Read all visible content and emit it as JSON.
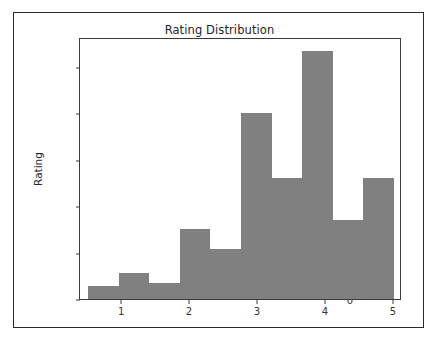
{
  "chart_data": {
    "type": "bar",
    "title": "Rating Distribution",
    "xlabel": "",
    "ylabel": "Rating",
    "xlim": [
      0.38,
      5.12
    ],
    "ylim": [
      0,
      28200
    ],
    "grid": false,
    "legend": null,
    "bin_edges": [
      0.5,
      0.95,
      1.4,
      1.85,
      2.3,
      2.75,
      3.2,
      3.65,
      4.1,
      4.55,
      5.0
    ],
    "categories": [
      "0.50-0.95",
      "0.95-1.40",
      "1.40-1.85",
      "1.85-2.30",
      "2.30-2.75",
      "2.75-3.20",
      "3.20-3.65",
      "3.65-4.10",
      "4.10-4.55",
      "4.55-5.00"
    ],
    "values": [
      1350,
      2850,
      1750,
      7500,
      5400,
      20000,
      13000,
      26700,
      8500,
      13000
    ],
    "bar_color": "#808080",
    "x_ticks": [
      1,
      2,
      3,
      4,
      5
    ],
    "x_tick_labels": [
      "1",
      "2",
      "3",
      "4",
      "5"
    ],
    "y_ticks": [
      0,
      5000,
      10000,
      15000,
      20000,
      25000
    ],
    "y_tick_labels": [
      "0",
      "5000",
      "10000",
      "15000",
      "20000",
      "25000"
    ]
  },
  "figure": {
    "background_color": "#ffffff",
    "border_color": "#2b2b2b",
    "axes_color": "#3a3a3a"
  }
}
